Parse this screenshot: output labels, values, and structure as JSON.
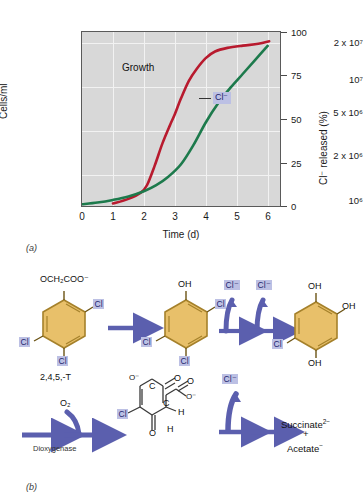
{
  "figure": {
    "panel_a_label": "(a)",
    "panel_b_label": "(b)"
  },
  "chart_data": {
    "type": "line",
    "title": "",
    "xlabel": "Time (d)",
    "ylabel": "Cells/ml",
    "ylabel_right": "Cl⁻ released (%)",
    "xlim": [
      0,
      6.4
    ],
    "ylim_left_log": [
      1000000,
      30000000
    ],
    "ylim_right": [
      0,
      100
    ],
    "grid": true,
    "plot_bg": "#d8d8d8",
    "grid_color": "#f2f2f2",
    "xticks": [
      "0",
      "1",
      "2",
      "3",
      "4",
      "5",
      "6"
    ],
    "xtick_values": [
      0,
      1,
      2,
      3,
      4,
      5,
      6
    ],
    "yticks_left": [
      "10⁶",
      "2 x 10⁶",
      "5 x 10⁶",
      "10⁷",
      "2 x 10⁷"
    ],
    "ytick_left_values": [
      1000000,
      2000000,
      5000000,
      10000000,
      20000000
    ],
    "yticks_right": [
      "0",
      "25",
      "50",
      "75",
      "100"
    ],
    "ytick_right_values": [
      0,
      25,
      50,
      75,
      100
    ],
    "legend_position": "inline-annotation",
    "series": [
      {
        "name": "Growth",
        "color": "#b81a2e",
        "axis": "left",
        "annotation": "Growth",
        "x": [
          1.0,
          1.5,
          1.9,
          2.1,
          2.35,
          2.6,
          2.85,
          3.0,
          3.2,
          3.45,
          3.7,
          4.0,
          4.3,
          4.7,
          5.2,
          5.7,
          6.05
        ],
        "y": [
          1050000,
          1150000,
          1300000,
          1500000,
          2200000,
          3400000,
          4900000,
          6000000,
          8200000,
          11500000,
          14500000,
          18000000,
          20500000,
          22000000,
          23000000,
          23800000,
          25000000
        ]
      },
      {
        "name": "Cl⁻",
        "color": "#1d7a4c",
        "axis": "right",
        "annotation": "Cl⁻",
        "x": [
          0.0,
          0.5,
          1.0,
          1.5,
          2.0,
          2.4,
          2.8,
          3.2,
          3.6,
          4.0,
          4.4,
          4.8,
          5.2,
          5.6,
          6.0
        ],
        "y": [
          1.0,
          2.0,
          3.5,
          5.5,
          8.5,
          12.0,
          17.0,
          24.0,
          35.0,
          48.0,
          59.0,
          68.0,
          76.0,
          84.0,
          92.0
        ]
      }
    ]
  },
  "pathway": {
    "row1": {
      "compound1": {
        "name": "2,4,5,-T",
        "top_group": "OCH₂COO⁻",
        "substituents": [
          "Cl",
          "Cl",
          "Cl"
        ]
      },
      "compound2": {
        "name": "",
        "top_group": "OH",
        "substituents": [
          "Cl",
          "Cl"
        ]
      },
      "compound3": {
        "name": "",
        "top_group": "OH",
        "substituents": [
          "OH",
          "OH",
          "Cl"
        ]
      },
      "released": [
        "Cl⁻",
        "Cl⁻"
      ]
    },
    "row2": {
      "reagent": "O₂",
      "enzyme": "Dioxygenase",
      "intermediate_atoms": [
        "O⁻",
        "C",
        "O",
        "C",
        "O",
        "O⁻",
        "Cl",
        "H",
        "H",
        "O"
      ],
      "released": "Cl⁻",
      "products_line1": "Succinate",
      "products_charge1": "2−",
      "products_plus": "+",
      "products_line2": "Acetate",
      "products_charge2": "−"
    }
  },
  "colors": {
    "growth_line": "#b81a2e",
    "chloride_line": "#1d7a4c",
    "arrow": "#5b5fae",
    "ring_fill": "#e8c06a",
    "ring_stroke": "#a5812b",
    "highlight_bg": "#bcc0e4",
    "highlight_text": "#26276e",
    "plot_bg": "#d8d8d8"
  }
}
